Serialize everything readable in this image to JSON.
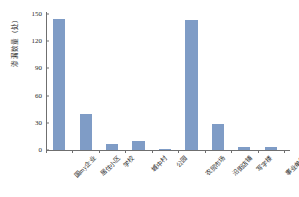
{
  "chart_data": {
    "type": "bar",
    "title": "",
    "xlabel": "",
    "ylabel": "渗漏数量（处）",
    "ylim": [
      0,
      150
    ],
    "yticks": [
      0,
      30,
      60,
      90,
      120,
      150
    ],
    "grid": false,
    "legend": "none",
    "bar_color": "#7f9cc6",
    "axis_color": "#6f6f6f",
    "categories": [
      "国my企业",
      "居住小区",
      "学校",
      "城中村",
      "公园",
      "农贸市场",
      "沿街店铺",
      "写字楼",
      "事业单位"
    ],
    "values": [
      144,
      40,
      7,
      10,
      1,
      143,
      29,
      3,
      3
    ]
  }
}
